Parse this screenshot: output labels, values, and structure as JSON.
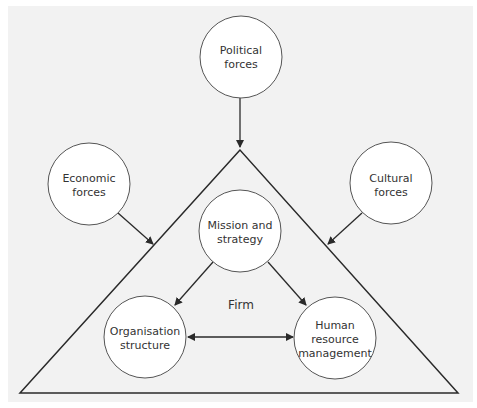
{
  "diagram": {
    "type": "influences-on-firm",
    "container_label": "Firm",
    "colors": {
      "background": "#ffffff",
      "panel": "#f2f2f2",
      "line": "#2a2a2a",
      "node_fill": "#ffffff",
      "node_stroke": "#555555",
      "text": "#333333"
    },
    "external_forces": [
      {
        "id": "political",
        "line1": "Political",
        "line2": "forces"
      },
      {
        "id": "economic",
        "line1": "Economic",
        "line2": "forces"
      },
      {
        "id": "cultural",
        "line1": "Cultural",
        "line2": "forces"
      }
    ],
    "internal_nodes": [
      {
        "id": "mission",
        "line1": "Mission and",
        "line2": "strategy"
      },
      {
        "id": "organisation",
        "line1": "Organisation",
        "line2": "structure"
      },
      {
        "id": "hrm",
        "line1": "Human",
        "line2": "resource",
        "line3": "management"
      }
    ],
    "edges": [
      {
        "from": "Political forces",
        "to": "Firm",
        "type": "arrow"
      },
      {
        "from": "Economic forces",
        "to": "Firm",
        "type": "arrow"
      },
      {
        "from": "Cultural forces",
        "to": "Firm",
        "type": "arrow"
      },
      {
        "from": "Mission and strategy",
        "to": "Organisation structure",
        "type": "arrow"
      },
      {
        "from": "Mission and strategy",
        "to": "Human resource management",
        "type": "arrow"
      },
      {
        "from": "Organisation structure",
        "to": "Human resource management",
        "type": "bidirectional"
      }
    ]
  }
}
